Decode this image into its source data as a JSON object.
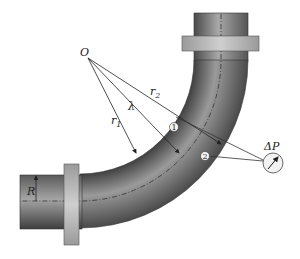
{
  "diagram": {
    "labels": {
      "origin": "O",
      "inner_radius": "r1",
      "inner_radius_base": "r",
      "inner_radius_sub": "1",
      "outer_radius_base": "r",
      "outer_radius_sub": "2",
      "center_radius": "λ",
      "pipe_radius": "R",
      "pressure_difference": "ΔP",
      "tap_1": "1",
      "tap_2": "2"
    },
    "colors": {
      "pipe_dark": "#3a3a3a",
      "pipe_mid": "#8a8a8a",
      "pipe_light": "#bdbdbd",
      "flange": "#b8b8b8",
      "line": "#222222",
      "gauge_fill": "#f2f2f2"
    }
  }
}
